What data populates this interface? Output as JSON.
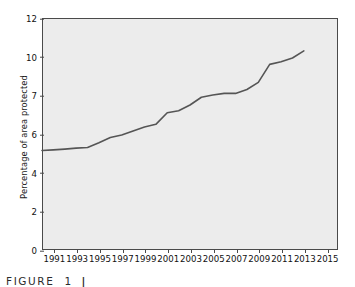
{
  "chart_data": {
    "type": "line",
    "title": "",
    "xlabel": "",
    "ylabel": "Percentage of area protected",
    "grid": false,
    "legend": "none",
    "line_color": "#555555",
    "plot_background": "#ececec",
    "axis_color": "#4a4a4a",
    "x_tick_labels": [
      "1991",
      "1993",
      "1995",
      "1997",
      "1999",
      "2001",
      "2003",
      "2005",
      "2007",
      "2009",
      "2011",
      "2013",
      "2015"
    ],
    "x_tick_values": [
      1991,
      1993,
      1995,
      1997,
      1999,
      2001,
      2003,
      2005,
      2007,
      2009,
      2011,
      2013,
      2015
    ],
    "xlim": [
      1990,
      2016
    ],
    "y_tick_labels": [
      "0",
      "2",
      "4",
      "6",
      "7",
      "10",
      "12"
    ],
    "y_tick_values": [
      0,
      2,
      4,
      6,
      7,
      10,
      12
    ],
    "y_axis_scale": "categorical-even-spacing",
    "ylim": [
      0,
      12
    ],
    "series": [
      {
        "name": "Percentage of area protected",
        "x": [
          1990,
          1991,
          1992,
          1993,
          1994,
          1995,
          1996,
          1997,
          1998,
          1999,
          2000,
          2001,
          2002,
          2003,
          2004,
          2005,
          2006,
          2007,
          2008,
          2009,
          2010,
          2011,
          2012,
          2013
        ],
        "values": [
          5.15,
          5.18,
          5.22,
          5.27,
          5.3,
          5.55,
          5.82,
          5.95,
          6.08,
          6.18,
          6.25,
          6.55,
          6.6,
          6.75,
          6.95,
          7.02,
          7.15,
          7.15,
          7.45,
          8.0,
          9.4,
          9.6,
          9.9,
          10.3
        ]
      }
    ]
  },
  "caption": {
    "label": "FIGURE",
    "number": "1",
    "separator": "|",
    "text": ""
  }
}
